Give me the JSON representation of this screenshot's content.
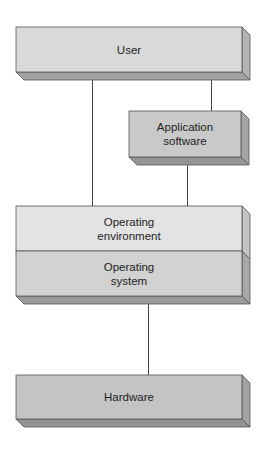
{
  "diagram": {
    "title": "",
    "nodes": [
      {
        "id": "user",
        "lines": [
          "User"
        ],
        "face": "#d9d9d9",
        "side": "#b3b3b3",
        "bottom": "#a3a3a3"
      },
      {
        "id": "application-software",
        "lines": [
          "Application",
          "software"
        ],
        "face": "#c9c9c9",
        "side": "#a6a6a6",
        "bottom": "#959595"
      },
      {
        "id": "operating-environment",
        "lines": [
          "Operating",
          "environment"
        ],
        "face": "#e3e3e3",
        "side": "#c4c4c4",
        "bottom": ""
      },
      {
        "id": "operating-system",
        "lines": [
          "Operating",
          "system"
        ],
        "face": "#d2d2d2",
        "side": "#a9a9a9",
        "bottom": "#9b9b9b"
      },
      {
        "id": "hardware",
        "lines": [
          "Hardware"
        ],
        "face": "#c4c4c4",
        "side": "#a3a3a3",
        "bottom": "#939393"
      }
    ],
    "edges": [
      {
        "from": "user",
        "to": "operating-environment"
      },
      {
        "from": "user",
        "to": "application-software"
      },
      {
        "from": "application-software",
        "to": "operating-environment"
      },
      {
        "from": "operating-system",
        "to": "hardware"
      }
    ],
    "colors": {
      "line": "#444444",
      "outline": "#555555",
      "text": "#222222"
    }
  }
}
